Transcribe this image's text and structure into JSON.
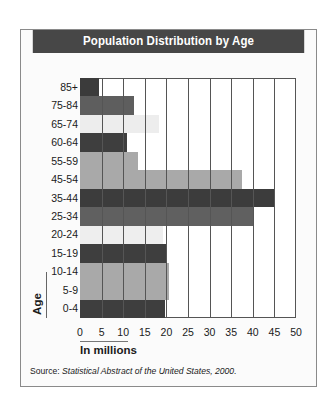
{
  "chart_data": {
    "type": "bar",
    "orientation": "horizontal",
    "title": "Population Distribution by Age",
    "xlabel": "In millions",
    "ylabel": "Age",
    "xlim": [
      0,
      50
    ],
    "x_ticks": [
      0,
      5,
      10,
      15,
      20,
      25,
      30,
      35,
      40,
      45,
      50
    ],
    "grid": "vertical",
    "legend": "none",
    "categories": [
      "85+",
      "75-84",
      "65-74",
      "60-64",
      "55-59",
      "45-54",
      "35-44",
      "25-34",
      "20-24",
      "15-19",
      "10-14",
      "5-9",
      "0-4"
    ],
    "values": [
      4.3,
      12.4,
      18.2,
      10.8,
      13.5,
      37.5,
      45.1,
      40.0,
      19.2,
      20.1,
      20.5,
      20.5,
      19.6
    ],
    "bar_colors": [
      "#3b3b3b",
      "#5e5e5e",
      "#ededed",
      "#3e3e3e",
      "#a9a9a9",
      "#a9a9a9",
      "#3c3c3c",
      "#606060",
      "#eeeeee",
      "#3e3e3e",
      "#a9a9a9",
      "#a9a9a9",
      "#3e3e3e"
    ],
    "source_prefix": "Source: ",
    "source_title": "Statistical Abstract of the United States, 2000."
  },
  "colors": {
    "title_bar": "#474747",
    "title_text": "#ffffff",
    "frame_border": "#8a8a8a",
    "gridline": "#555555"
  }
}
